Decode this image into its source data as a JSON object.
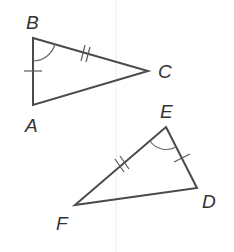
{
  "diagram": {
    "triangle_1": {
      "name": "ABC",
      "vertices": {
        "A": {
          "label": "A",
          "x": 33,
          "y": 105
        },
        "B": {
          "label": "B",
          "x": 33,
          "y": 38
        },
        "C": {
          "label": "C",
          "x": 148,
          "y": 71
        }
      },
      "markings": {
        "side_AB": "single tick",
        "side_BC": "double tick",
        "angle_B": "single arc"
      }
    },
    "triangle_2": {
      "name": "EDF",
      "vertices": {
        "E": {
          "label": "E",
          "x": 166,
          "y": 127
        },
        "D": {
          "label": "D",
          "x": 197,
          "y": 188
        },
        "F": {
          "label": "F",
          "x": 75,
          "y": 205
        }
      },
      "markings": {
        "side_ED": "single tick",
        "side_EF": "double tick",
        "angle_E": "single arc"
      }
    },
    "labels": {
      "A": "A",
      "B": "B",
      "C": "C",
      "D": "D",
      "E": "E",
      "F": "F"
    },
    "colors": {
      "line": "#4a4a4a",
      "text": "#333333",
      "background": "#ffffff"
    }
  }
}
